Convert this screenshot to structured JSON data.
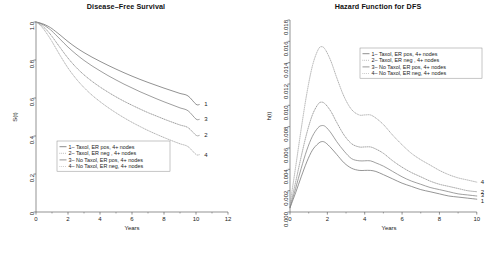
{
  "chart_data": [
    {
      "id": "disease-free-survival",
      "type": "line",
      "title": "Disease–Free Survival",
      "xlabel": "Years",
      "ylabel": "S(t)",
      "xlim": [
        0,
        12
      ],
      "ylim": [
        0,
        1.0
      ],
      "xticks": [
        0,
        2,
        4,
        6,
        8,
        10,
        12
      ],
      "xticklabels": [
        "0",
        "2",
        "4",
        "6",
        "8",
        "10",
        "12"
      ],
      "yticks": [
        0,
        0.2,
        0.4,
        0.6,
        0.8,
        1.0
      ],
      "yticklabels": [
        "0",
        "0.2",
        "0.4",
        "0.6",
        "0.8",
        "1.0"
      ],
      "grid": false,
      "legend_position": "lower-left",
      "legend_entries": [
        "1– Taxol, ER pos, 4+ nodes",
        "2– Taxol, ER neg , 4+ nodes",
        "3– No Taxol, ER pos, 4+ nodes",
        "4– No Taxol, ER neg, 4+ nodes"
      ],
      "x": [
        0,
        0.25,
        0.5,
        0.75,
        1,
        1.5,
        2,
        2.5,
        3,
        3.5,
        4,
        4.5,
        5,
        5.5,
        6,
        6.5,
        7,
        7.5,
        8,
        8.5,
        9,
        9.5,
        10,
        10.2
      ],
      "series": [
        {
          "name": "1– Taxol, ER pos, 4+ nodes",
          "end_label": "1",
          "style": "solid",
          "color": "#6e6e6e",
          "values": [
            1.0,
            0.995,
            0.988,
            0.978,
            0.965,
            0.932,
            0.897,
            0.866,
            0.839,
            0.815,
            0.793,
            0.772,
            0.752,
            0.733,
            0.715,
            0.698,
            0.682,
            0.667,
            0.652,
            0.638,
            0.624,
            0.611,
            0.567,
            0.566
          ]
        },
        {
          "name": "2– Taxol, ER neg , 4+ nodes",
          "end_label": "2",
          "style": "dotted",
          "color": "#8f8f8f",
          "values": [
            1.0,
            0.989,
            0.972,
            0.95,
            0.924,
            0.866,
            0.81,
            0.762,
            0.722,
            0.688,
            0.658,
            0.631,
            0.606,
            0.583,
            0.562,
            0.542,
            0.523,
            0.506,
            0.489,
            0.473,
            0.458,
            0.444,
            0.404,
            0.403
          ]
        },
        {
          "name": "3– No Taxol, ER pos, 4+ nodes",
          "end_label": "3",
          "style": "solid",
          "color": "#7d7d7d",
          "values": [
            1.0,
            0.993,
            0.983,
            0.969,
            0.952,
            0.91,
            0.868,
            0.831,
            0.798,
            0.769,
            0.743,
            0.718,
            0.695,
            0.673,
            0.653,
            0.633,
            0.615,
            0.597,
            0.58,
            0.564,
            0.548,
            0.533,
            0.489,
            0.488
          ]
        },
        {
          "name": "4– No Taxol, ER neg, 4+ nodes",
          "end_label": "4",
          "style": "dotted",
          "color": "#a8a8a8",
          "values": [
            1.0,
            0.984,
            0.96,
            0.93,
            0.897,
            0.825,
            0.758,
            0.702,
            0.655,
            0.615,
            0.581,
            0.55,
            0.522,
            0.496,
            0.472,
            0.45,
            0.429,
            0.41,
            0.392,
            0.375,
            0.359,
            0.344,
            0.303,
            0.302
          ]
        }
      ]
    },
    {
      "id": "hazard-function-dfs",
      "type": "line",
      "title": "Hazard Function for DFS",
      "xlabel": "Years",
      "ylabel": "h(t)",
      "xlim": [
        0,
        10.6
      ],
      "ylim": [
        0,
        0.018
      ],
      "xticks": [
        0,
        2,
        4,
        6,
        8,
        10
      ],
      "xticklabels": [
        "0",
        "2",
        "4",
        "6",
        "8",
        "10"
      ],
      "yticks": [
        0,
        0.002,
        0.004,
        0.006,
        0.008,
        0.01,
        0.012,
        0.014,
        0.016,
        0.018
      ],
      "yticklabels": [
        "0.000",
        "0.002",
        "0.004",
        "0.006",
        "0.008",
        "0.010",
        "0.012",
        "0.014",
        "0.016",
        "0.018"
      ],
      "grid": false,
      "legend_position": "upper-right",
      "legend_entries": [
        "1– Taxol, ER pos, 4+ nodes",
        "2– Taxol, ER neg , 4+ nodes",
        "3– No Taxol, ER pos, 4+ nodes",
        "4– No Taxol, ER neg, 4+ nodes"
      ],
      "x": [
        0,
        0.3,
        0.6,
        0.9,
        1.2,
        1.5,
        1.7,
        1.9,
        2.2,
        2.5,
        2.9,
        3.3,
        3.7,
        4.0,
        4.3,
        4.6,
        5.0,
        5.5,
        6.0,
        6.5,
        7.0,
        7.5,
        8.0,
        8.5,
        9.0,
        9.5,
        10.0
      ],
      "series": [
        {
          "name": "1– Taxol, ER pos, 4+ nodes",
          "end_label": "1",
          "style": "solid",
          "color": "#737373",
          "values": [
            0.0004,
            0.0018,
            0.0033,
            0.0047,
            0.0058,
            0.0064,
            0.0066,
            0.0065,
            0.006,
            0.0054,
            0.0046,
            0.0041,
            0.0039,
            0.0039,
            0.0039,
            0.0038,
            0.0035,
            0.0031,
            0.0027,
            0.0024,
            0.0021,
            0.0019,
            0.0017,
            0.0015,
            0.0014,
            0.0013,
            0.0012
          ]
        },
        {
          "name": "2– Taxol, ER neg , 4+ nodes",
          "end_label": "2",
          "style": "dotted",
          "color": "#909090",
          "values": [
            0.0005,
            0.0028,
            0.0052,
            0.0074,
            0.0091,
            0.0101,
            0.0103,
            0.0101,
            0.0094,
            0.0084,
            0.0072,
            0.0064,
            0.0061,
            0.0061,
            0.0061,
            0.0059,
            0.0055,
            0.0048,
            0.0042,
            0.0037,
            0.0033,
            0.0029,
            0.0026,
            0.0024,
            0.0022,
            0.002,
            0.0019
          ]
        },
        {
          "name": "3– No Taxol, ER pos, 4+ nodes",
          "end_label": "3",
          "style": "solid",
          "color": "#808080",
          "values": [
            0.0004,
            0.0022,
            0.0041,
            0.0058,
            0.0071,
            0.0079,
            0.0081,
            0.008,
            0.0074,
            0.0066,
            0.0057,
            0.005,
            0.0048,
            0.0048,
            0.0048,
            0.0046,
            0.0043,
            0.0038,
            0.0033,
            0.0029,
            0.0026,
            0.0023,
            0.0021,
            0.0019,
            0.0017,
            0.0016,
            0.0015
          ]
        },
        {
          "name": "4– No Taxol, ER neg, 4+ nodes",
          "end_label": "4",
          "style": "dotted",
          "color": "#a5a5a5",
          "values": [
            0.0007,
            0.0042,
            0.0078,
            0.0111,
            0.0137,
            0.0152,
            0.0155,
            0.0152,
            0.0141,
            0.0126,
            0.0108,
            0.0096,
            0.0091,
            0.0091,
            0.0091,
            0.0088,
            0.0082,
            0.0072,
            0.0063,
            0.0055,
            0.0049,
            0.0044,
            0.0039,
            0.0035,
            0.0032,
            0.003,
            0.0028
          ]
        }
      ]
    }
  ]
}
